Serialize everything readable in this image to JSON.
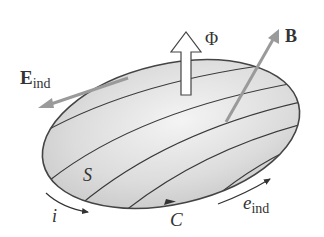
{
  "diagram": {
    "labels": {
      "flux": "Φ",
      "magnetic_field": "B",
      "induced_field_main": "E",
      "induced_field_sub": "ind",
      "surface": "S",
      "curve": "C",
      "current": "i",
      "emf_main": "e",
      "emf_sub": "ind"
    },
    "colors": {
      "surface_fill": "#d6d6d6",
      "surface_highlight": "#f2f2f2",
      "outline": "#444444",
      "field_lines": "#3a3a3a",
      "vector_gray": "#9a9a9a",
      "text": "#333333"
    }
  }
}
